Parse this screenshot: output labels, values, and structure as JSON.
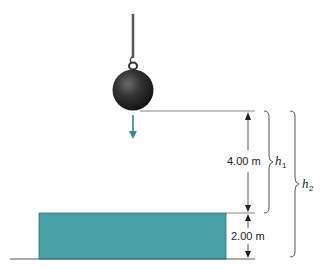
{
  "diagram": {
    "type": "physics-free-fall",
    "labels": {
      "h1_distance": "4.00 m",
      "box_height": "2.00 m",
      "h1_symbol": "h",
      "h1_subscript": "1",
      "h2_symbol": "h",
      "h2_subscript": "2"
    },
    "colors": {
      "box_fill": "#4a9fa6",
      "box_stroke": "#2f6f74",
      "ball": "#2a2a2a",
      "arrow": "#2a8c8c",
      "lines": "#555555"
    }
  }
}
